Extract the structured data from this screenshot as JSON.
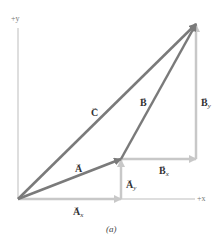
{
  "diagram": {
    "caption": "(a)",
    "axes": {
      "x_label": "+x",
      "y_label": "+y"
    },
    "vectors": [
      {
        "name": "A",
        "label": "A",
        "from": [
          18,
          199
        ],
        "to": [
          121,
          159
        ],
        "color": "#7a7a7a"
      },
      {
        "name": "B",
        "label": "B",
        "from": [
          121,
          159
        ],
        "to": [
          196,
          24
        ],
        "color": "#7a7a7a"
      },
      {
        "name": "C",
        "label": "C",
        "from": [
          18,
          199
        ],
        "to": [
          196,
          24
        ],
        "color": "#7a7a7a"
      }
    ],
    "components": [
      {
        "name": "Ax",
        "label": "A",
        "subscript": "x"
      },
      {
        "name": "Ay",
        "label": "A",
        "subscript": "y"
      },
      {
        "name": "Bx",
        "label": "B",
        "subscript": "x"
      },
      {
        "name": "By",
        "label": "B",
        "subscript": "y"
      }
    ],
    "colors": {
      "vector": "#7a7a7a",
      "component": "#c8c8c8",
      "axis": "#bdbdbd"
    }
  }
}
